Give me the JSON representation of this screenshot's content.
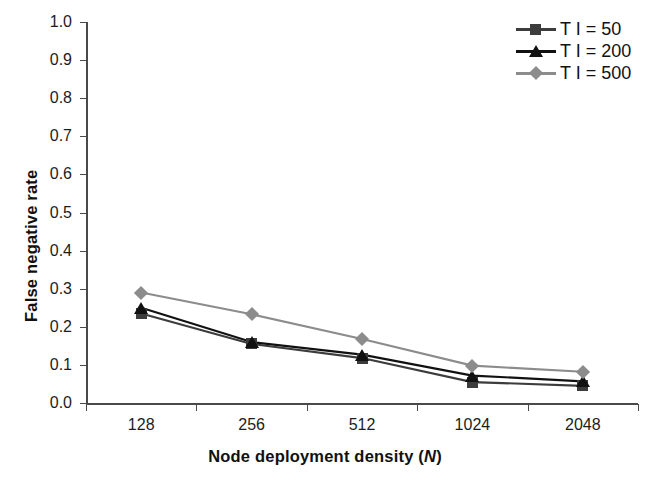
{
  "chart_data": {
    "type": "line",
    "title": "",
    "xlabel": "Node deployment density (N)",
    "ylabel": "False negative rate",
    "categories": [
      "128",
      "256",
      "512",
      "1024",
      "2048"
    ],
    "x": [
      128,
      256,
      512,
      1024,
      2048
    ],
    "xscale": "categorical (log2 spaced labels)",
    "ylim": [
      0.0,
      1.0
    ],
    "ytick_labels": [
      "1.0",
      "0.9",
      "0.8",
      "0.7",
      "0.6",
      "0.5",
      "0.4",
      "0.3",
      "0.2",
      "0.1",
      "0.0"
    ],
    "ytick_values": [
      1.0,
      0.9,
      0.8,
      0.7,
      0.6,
      0.5,
      0.4,
      0.3,
      0.2,
      0.1,
      0.0
    ],
    "grid": false,
    "legend_position": "top-right",
    "series": [
      {
        "name": "T I = 50",
        "marker": "square",
        "color": "#3c3c3c",
        "values": [
          0.235,
          0.155,
          0.118,
          0.055,
          0.045
        ]
      },
      {
        "name": "T I = 200",
        "marker": "triangle",
        "color": "#111111",
        "values": [
          0.25,
          0.16,
          0.127,
          0.072,
          0.057
        ]
      },
      {
        "name": "T I = 500",
        "marker": "diamond",
        "color": "#8c8c8c",
        "values": [
          0.29,
          0.233,
          0.168,
          0.098,
          0.082
        ]
      }
    ]
  },
  "axis": {
    "y_title": "False negative rate",
    "x_title_main": "Node deployment density (",
    "x_title_italic": "N",
    "x_title_end": ")"
  },
  "legend": {
    "items": [
      {
        "label": "T I = 50",
        "icon": "square-marker-icon"
      },
      {
        "label": "T I = 200",
        "icon": "triangle-marker-icon"
      },
      {
        "label": "T I = 500",
        "icon": "diamond-marker-icon"
      }
    ]
  }
}
